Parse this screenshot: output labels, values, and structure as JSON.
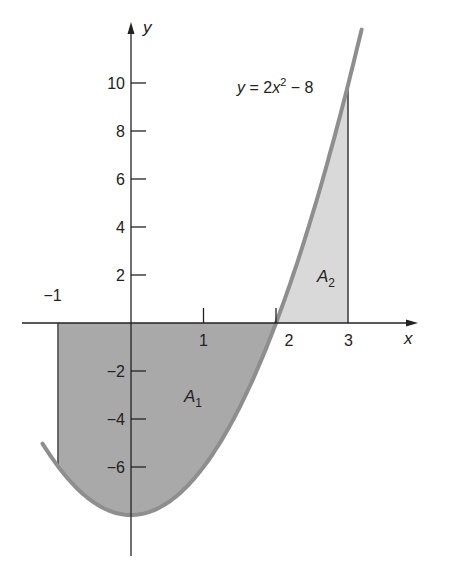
{
  "figure": {
    "equation_label": {
      "y": "y",
      "eq": " = 2",
      "x": "x",
      "exp": "2",
      "rest": " − 8"
    },
    "x_axis_label": "x",
    "y_axis_label": "y",
    "x_ticks": [
      {
        "value": -1,
        "label": "−1"
      },
      {
        "value": 1,
        "label": "1"
      },
      {
        "value": 2,
        "label": "2"
      },
      {
        "value": 3,
        "label": "3"
      }
    ],
    "y_ticks": [
      {
        "value": 10,
        "label": "10"
      },
      {
        "value": 8,
        "label": "8"
      },
      {
        "value": 6,
        "label": "6"
      },
      {
        "value": 4,
        "label": "4"
      },
      {
        "value": 2,
        "label": "2"
      },
      {
        "value": -2,
        "label": "−2"
      },
      {
        "value": -4,
        "label": "−4"
      },
      {
        "value": -6,
        "label": "−6"
      }
    ],
    "regions": [
      {
        "name": "A",
        "sub": "1",
        "from": -1,
        "to": 2,
        "color": "#a9a9a9"
      },
      {
        "name": "A",
        "sub": "2",
        "from": 2,
        "to": 3,
        "color": "#d9d9d9"
      }
    ],
    "curve_color": "#8e8e8e"
  },
  "chart_data": {
    "type": "area",
    "title": "",
    "function": "y = 2x^2 - 8",
    "x": [
      -1.2,
      -1,
      0,
      1,
      2,
      3,
      3.2
    ],
    "y": [
      -5.12,
      -6,
      -8,
      -6,
      0,
      10,
      12.48
    ],
    "xlabel": "x",
    "ylabel": "y",
    "xlim": [
      -1.4,
      3.8
    ],
    "ylim": [
      -9.5,
      12.5
    ],
    "x_ticks": [
      -1,
      1,
      2,
      3
    ],
    "y_ticks": [
      -6,
      -4,
      -2,
      2,
      4,
      6,
      8,
      10
    ],
    "shaded_regions": [
      {
        "label": "A1",
        "x_from": -1,
        "x_to": 2,
        "between": "curve and x-axis (below axis)"
      },
      {
        "label": "A2",
        "x_from": 2,
        "x_to": 3,
        "between": "curve and x-axis (above axis)"
      }
    ],
    "annotations": [
      "y = 2x² − 8",
      "A₁",
      "A₂"
    ],
    "grid": false
  }
}
